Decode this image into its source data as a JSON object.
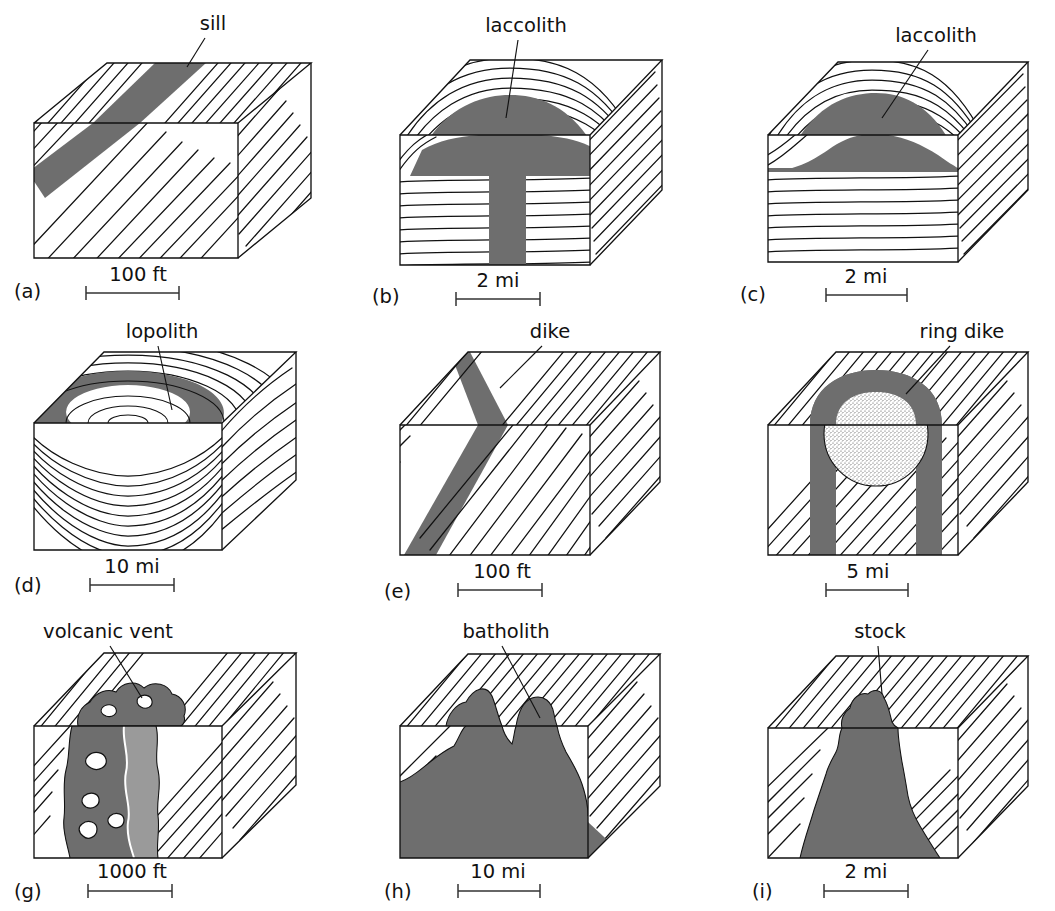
{
  "figure": {
    "background_color": "#ffffff",
    "intrusion_fill_color": "#6e6e6e",
    "intrusion_fill_light": "#9a9a9a",
    "line_color": "#111111",
    "stipple_color": "#555555"
  },
  "panels": [
    {
      "letter": "(a)",
      "label": "sill",
      "scale": "100 ft",
      "feature": "sill",
      "strata_style": "inclined-diagonal",
      "description": "Concordant tabular dark band following inclined bedding planes"
    },
    {
      "letter": "(b)",
      "label": "laccolith",
      "scale": "2 mi",
      "feature": "laccolith-with-feeder-dike",
      "strata_style": "domed-over-flat",
      "description": "Mushroom shaped intrusion doming overlying strata with vertical feeder dike below"
    },
    {
      "letter": "(c)",
      "label": "laccolith",
      "scale": "2 mi",
      "feature": "laccolith-flat-floor",
      "strata_style": "domed-over-flat",
      "description": "Dome shaped intrusion with flat floor resting on horizontal strata"
    },
    {
      "letter": "(d)",
      "label": "lopolith",
      "scale": "10 mi",
      "feature": "lopolith",
      "strata_style": "concentric-saucer",
      "description": "Saucer shaped body shown as dark elliptical annulus with nested concentric rings"
    },
    {
      "letter": "(e)",
      "label": "dike",
      "scale": "100 ft",
      "feature": "dike",
      "strata_style": "inclined-diagonal",
      "description": "Discordant steeply dipping tabular dark band cutting across bedding"
    },
    {
      "letter": "",
      "label": "ring dike",
      "scale": "5 mi",
      "feature": "ring-dike",
      "strata_style": "inclined-diagonal",
      "description": "Arch shaped dark band enclosing a stippled circular core of country rock"
    },
    {
      "letter": "(g)",
      "label": "volcanic vent",
      "scale": "1000 ft",
      "feature": "volcanic-vent",
      "strata_style": "inclined-diagonal",
      "description": "Irregular vertical pipe of dark rock containing lighter angular inclusions"
    },
    {
      "letter": "(h)",
      "label": "batholith",
      "scale": "10 mi",
      "feature": "batholith",
      "strata_style": "inclined-diagonal",
      "description": "Very large discordant mass filling lower block with irregular domed upper contact"
    },
    {
      "letter": "(i)",
      "label": "stock",
      "scale": "2 mi",
      "feature": "stock",
      "strata_style": "inclined-diagonal",
      "description": "Smaller discordant tapered intrusive body narrower than a batholith"
    }
  ]
}
